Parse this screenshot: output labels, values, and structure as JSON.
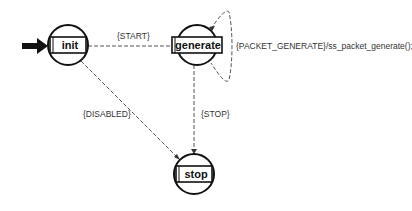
{
  "diagram": {
    "type": "state-machine",
    "initial_state": "init",
    "states": [
      {
        "id": "init",
        "label": "init"
      },
      {
        "id": "generate",
        "label": "generate"
      },
      {
        "id": "stop",
        "label": "stop"
      }
    ],
    "transitions": [
      {
        "id": "start",
        "from": "init",
        "to": "generate",
        "label": "{START}"
      },
      {
        "id": "disabled",
        "from": "init",
        "to": "stop",
        "label": "{DISABLED}"
      },
      {
        "id": "stop",
        "from": "generate",
        "to": "stop",
        "label": "{STOP}"
      },
      {
        "id": "packet-generate",
        "from": "generate",
        "to": "generate",
        "label": "{PACKET_GENERATE}/ss_packet_generate();"
      }
    ]
  }
}
